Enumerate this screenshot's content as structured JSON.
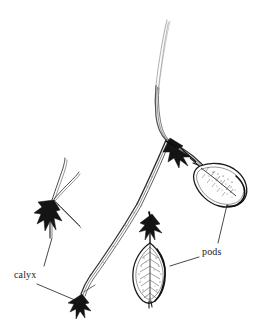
{
  "figure": {
    "kind": "botanical-line-illustration",
    "background_color": "#ffffff",
    "ink_color": "#1a1a1a",
    "faint_ink_color": "#9a9a9a",
    "width": 254,
    "height": 332
  },
  "labels": [
    {
      "id": "calyx",
      "text": "calyx",
      "x": 14,
      "y": 269,
      "leader_lines": [
        {
          "from_x": 44,
          "from_y": 266,
          "to_x": 52,
          "to_y": 238
        },
        {
          "from_x": 37,
          "from_y": 284,
          "to_x": 82,
          "to_y": 303
        }
      ]
    },
    {
      "id": "pods",
      "text": "pods",
      "x": 202,
      "y": 246,
      "leader_lines": [
        {
          "from_x": 218,
          "from_y": 243,
          "to_x": 227,
          "to_y": 205
        },
        {
          "from_x": 199,
          "from_y": 257,
          "to_x": 172,
          "to_y": 266
        }
      ]
    }
  ],
  "parts": [
    {
      "id": "main-stem",
      "name": "main-stem",
      "description": "long arching stem from top center curving down to lower left"
    },
    {
      "id": "pod-upper",
      "name": "pod-upper-right",
      "description": "elongated pointed seed pod with veins, upper right"
    },
    {
      "id": "pod-lower",
      "name": "pod-lower-center",
      "description": "elongated pointed seed pod with veins, hanging below center"
    },
    {
      "id": "calyx-upper",
      "name": "calyx-at-upper-pod",
      "description": "dark star-shaped calyx at base of upper pod"
    },
    {
      "id": "calyx-lower",
      "name": "calyx-at-lower-pod",
      "description": "dark star-shaped calyx at top of lower pod"
    },
    {
      "id": "calyx-detached",
      "name": "calyx-detail-specimen",
      "description": "isolated calyx specimen at left with thin style filaments"
    },
    {
      "id": "calyx-bottom",
      "name": "calyx-at-stem-tip",
      "description": "dark calyx at the lower-left tip of the stem"
    }
  ]
}
